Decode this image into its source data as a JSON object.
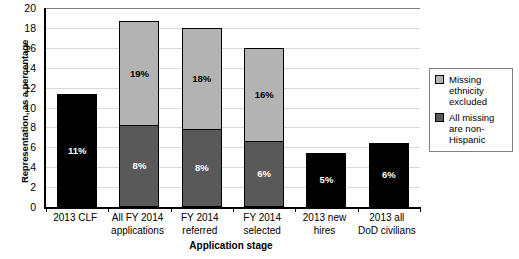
{
  "chart_data": {
    "type": "bar",
    "title": "",
    "xlabel": "Application stage",
    "ylabel": "Representation, as a percentage",
    "ylim": [
      0,
      20
    ],
    "yticks": [
      0,
      2,
      4,
      6,
      8,
      10,
      12,
      14,
      16,
      18,
      20
    ],
    "grid": true,
    "stacked": true,
    "legend_position": "right",
    "categories": [
      "2013 CLF",
      "All FY 2014 applications",
      "FY 2014 referred",
      "FY 2014 selected",
      "2013 new hires",
      "2013 all DoD civilians"
    ],
    "category_lines": [
      [
        "2013 CLF"
      ],
      [
        "All FY 2014",
        "applications"
      ],
      [
        "FY 2014",
        "referred"
      ],
      [
        "FY 2014",
        "selected"
      ],
      [
        "2013 new",
        "hires"
      ],
      [
        "2013 all",
        "DoD civilians"
      ]
    ],
    "series": [
      {
        "name": "All missing are non-Hispanic",
        "color": "#595959",
        "values": [
          null,
          8.2,
          7.8,
          6.6,
          null,
          null
        ],
        "labels": [
          "",
          "8%",
          "8%",
          "6%",
          "",
          ""
        ]
      },
      {
        "name": "Missing ethnicity excluded",
        "color": "#b3b3b3",
        "values": [
          null,
          10.6,
          10.3,
          9.5,
          null,
          null
        ],
        "labels": [
          "",
          "19%",
          "18%",
          "16%",
          "",
          ""
        ]
      },
      {
        "name": "Single value",
        "color": "#000000",
        "values": [
          11.4,
          null,
          null,
          null,
          5.4,
          6.4
        ],
        "labels": [
          "11%",
          "",
          "",
          "",
          "5%",
          "6%"
        ]
      }
    ],
    "legend": [
      {
        "label_lines": [
          "Missing",
          "ethnicity",
          "excluded"
        ],
        "color": "#b3b3b3"
      },
      {
        "label_lines": [
          "All missing",
          "are non-",
          "Hispanic"
        ],
        "color": "#595959"
      }
    ],
    "colors": {
      "light_gray": "#b3b3b3",
      "dark_gray": "#595959",
      "black": "#000000",
      "gridline": "#d9d9d9",
      "axis": "#000000",
      "legend_border": "#808080"
    }
  }
}
